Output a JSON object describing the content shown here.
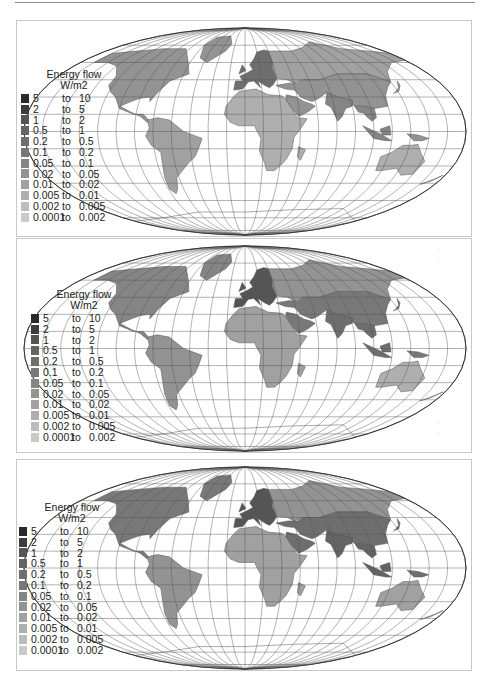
{
  "figure": {
    "panels": [
      {
        "id": "panel-1",
        "legend": {
          "title_line1": "Energy flow",
          "title_line2": "W/m2"
        }
      },
      {
        "id": "panel-2",
        "legend": {
          "title_line1": "Energy flow",
          "title_line2": "W/m2"
        }
      },
      {
        "id": "panel-3",
        "legend": {
          "title_line1": "Energy flow",
          "title_line2": "W/m2"
        }
      }
    ],
    "legend_classes": [
      {
        "from": "5",
        "to_word": "to",
        "to": "10",
        "color": "#2a2a2a"
      },
      {
        "from": "2",
        "to_word": "to",
        "to": "5",
        "color": "#3c3c3c"
      },
      {
        "from": "1",
        "to_word": "to",
        "to": "2",
        "color": "#555555"
      },
      {
        "from": "0.5",
        "to_word": "to",
        "to": "1",
        "color": "#646464"
      },
      {
        "from": "0.2",
        "to_word": "to",
        "to": "0.5",
        "color": "#6e6e6e"
      },
      {
        "from": "0.1",
        "to_word": "to",
        "to": "0.2",
        "color": "#787878"
      },
      {
        "from": "0.05",
        "to_word": "to",
        "to": "0.1",
        "color": "#858585"
      },
      {
        "from": "0.02",
        "to_word": "to",
        "to": "0.05",
        "color": "#939393"
      },
      {
        "from": "0.01",
        "to_word": "to",
        "to": "0.02",
        "color": "#a1a1a1"
      },
      {
        "from": "0.005",
        "to_word": "to",
        "to": "0.01",
        "color": "#afafaf"
      },
      {
        "from": "0.002",
        "to_word": "to",
        "to": "0.005",
        "color": "#bcbcbc"
      },
      {
        "from": "0.0001",
        "to_word": "to",
        "to": "0.002",
        "color": "#c9c9c9"
      }
    ],
    "projection": "Mollweide world map with graticule",
    "regions_shading": {
      "panel-1": {
        "europe": "#6e6e6e",
        "north_america": "#939393",
        "south_america": "#a1a1a1",
        "africa": "#afafaf",
        "asia": "#939393",
        "south_asia": "#858585",
        "australia": "#afafaf",
        "russia": "#a1a1a1"
      },
      "panel-2": {
        "europe": "#555555",
        "north_america": "#858585",
        "south_america": "#939393",
        "africa": "#a1a1a1",
        "asia": "#787878",
        "south_asia": "#6e6e6e",
        "australia": "#afafaf",
        "russia": "#939393"
      },
      "panel-3": {
        "europe": "#555555",
        "north_america": "#787878",
        "south_america": "#939393",
        "africa": "#a1a1a1",
        "asia": "#6e6e6e",
        "south_asia": "#646464",
        "australia": "#a1a1a1",
        "russia": "#939393"
      }
    }
  }
}
